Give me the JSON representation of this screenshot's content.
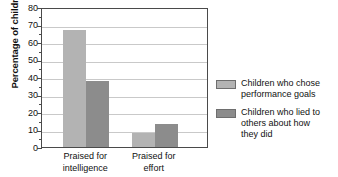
{
  "chart_data": {
    "type": "bar",
    "title": "",
    "xlabel": "",
    "ylabel": "Percentage of children",
    "ylim": [
      0,
      80
    ],
    "ytick_step": 10,
    "grid": true,
    "legend_position": "right",
    "categories": [
      "Praised for intelligence",
      "Praised for effort"
    ],
    "category_lines": [
      [
        "Praised for",
        "intelligence"
      ],
      [
        "Praised for",
        "effort"
      ]
    ],
    "yticks": [
      "80",
      "70",
      "60",
      "50",
      "40",
      "30",
      "20",
      "10",
      "0"
    ],
    "series": [
      {
        "name": "Children who chose performance goals",
        "name_lines": [
          "Children who chose",
          "performance goals"
        ],
        "color": "#b3b3b3",
        "values": [
          67,
          8
        ]
      },
      {
        "name": "Children who lied to others about how they did",
        "name_lines": [
          "Children who lied to",
          "others about how",
          "they did"
        ],
        "color": "#8c8c8c",
        "values": [
          38,
          13
        ]
      }
    ]
  },
  "colors": {
    "series_a": "#b3b3b3",
    "series_b": "#8c8c8c",
    "axis": "#4a4a4a",
    "gridline": "#c9c9c9",
    "text": "#111111",
    "background": "#ffffff"
  }
}
